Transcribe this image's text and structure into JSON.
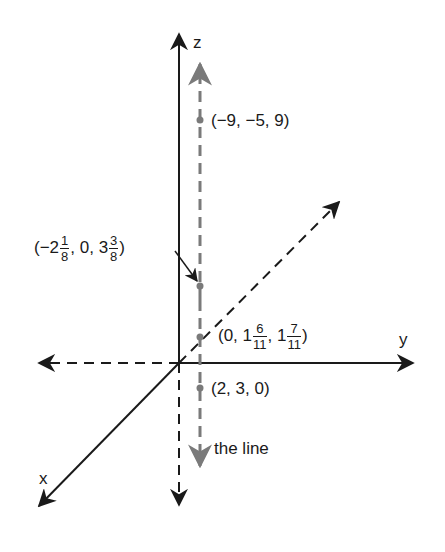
{
  "diagram": {
    "colors": {
      "axis": "#1a1a1a",
      "line": "#7a7a7a",
      "background": "#ffffff"
    },
    "axes": {
      "z_label": "z",
      "y_label": "y",
      "x_label": "x"
    },
    "line_label": "the line",
    "points": [
      {
        "id": "p1",
        "label": "(−9, −5, 9)",
        "x": -9,
        "y": -5,
        "z": 9
      },
      {
        "id": "p2",
        "label_parts": {
          "open": "(−2",
          "f1_num": "1",
          "f1_den": "8",
          "mid": ", 0, 3",
          "f2_num": "3",
          "f2_den": "8",
          "close": ")"
        },
        "x": "-2 1/8",
        "y": "0",
        "z": "3 3/8"
      },
      {
        "id": "p3",
        "label_parts": {
          "open": "(0, 1",
          "f1_num": "6",
          "f1_den": "11",
          "mid": ", 1",
          "f2_num": "7",
          "f2_den": "11",
          "close": ")"
        },
        "x": "0",
        "y": "1 6/11",
        "z": "1 7/11"
      },
      {
        "id": "p4",
        "label": "(2, 3, 0)",
        "x": 2,
        "y": 3,
        "z": 0
      }
    ]
  }
}
